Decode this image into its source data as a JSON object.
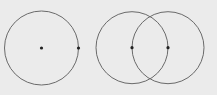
{
  "diagram": {
    "background": "#ebebeb",
    "stroke_color": "#6a6a6a",
    "point_color": "#222222",
    "figures": [
      {
        "name": "single-circle",
        "circles": [
          {
            "cx": 41.5,
            "cy": 48,
            "r": 37
          }
        ],
        "points": [
          {
            "name": "center",
            "x": 41.5,
            "y": 48
          },
          {
            "name": "on-circumference",
            "x": 78.5,
            "y": 48
          }
        ]
      },
      {
        "name": "two-intersecting-circles",
        "circles": [
          {
            "cx": 132,
            "cy": 47.7,
            "r": 36
          },
          {
            "cx": 168,
            "cy": 47.7,
            "r": 36
          }
        ],
        "points": [
          {
            "name": "center-a",
            "x": 132,
            "y": 47.7
          },
          {
            "name": "center-b",
            "x": 168,
            "y": 47.7
          }
        ]
      }
    ]
  }
}
